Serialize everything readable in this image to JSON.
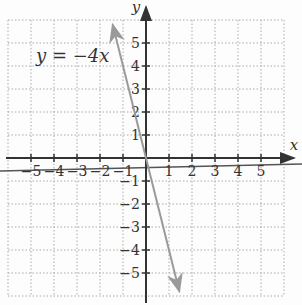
{
  "chart_data": {
    "type": "line",
    "title": "",
    "equation_label": "y = −4x",
    "xlabel": "x",
    "ylabel": "y",
    "xlim": [
      -6,
      6
    ],
    "ylim": [
      -6,
      6
    ],
    "grid": true,
    "x_ticks": [
      -5,
      -4,
      -3,
      -2,
      -1,
      1,
      2,
      3,
      4,
      5
    ],
    "y_ticks": [
      -5,
      -4,
      -3,
      -2,
      -1,
      1,
      2,
      3,
      4,
      5
    ],
    "series": [
      {
        "name": "y = -4x",
        "x": [
          -1.45,
          1.45
        ],
        "y": [
          5.8,
          -5.8
        ],
        "color": "#9a9a9a",
        "arrows": "both"
      }
    ],
    "colors": {
      "axis": "#333333",
      "grid": "#aaaaaa",
      "line": "#9a9a9a",
      "stray_line": "#555555"
    }
  }
}
